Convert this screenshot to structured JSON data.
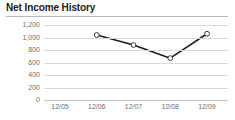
{
  "chart_data": {
    "type": "line",
    "title": "Net Income History",
    "xlabel": "",
    "ylabel": "",
    "categories": [
      "12/05",
      "12/06",
      "12/07",
      "12/08",
      "12/09"
    ],
    "series": [
      {
        "name": "Net Income",
        "values": [
          null,
          1040,
          880,
          670,
          1060
        ]
      }
    ],
    "ylim": [
      0,
      1200
    ],
    "yticks": [
      0,
      200,
      400,
      600,
      800,
      1000,
      1200
    ],
    "ytick_labels": [
      "0",
      "200",
      "400",
      "600",
      "800",
      "1,000",
      "1,200"
    ],
    "grid": true,
    "legend": "none",
    "marker": "open-circle",
    "line_color": "#1c1c1c",
    "grid_color": "#d8d8d8",
    "axis_label_color": "#6e6e6e",
    "title_color": "#1a1a1a"
  }
}
